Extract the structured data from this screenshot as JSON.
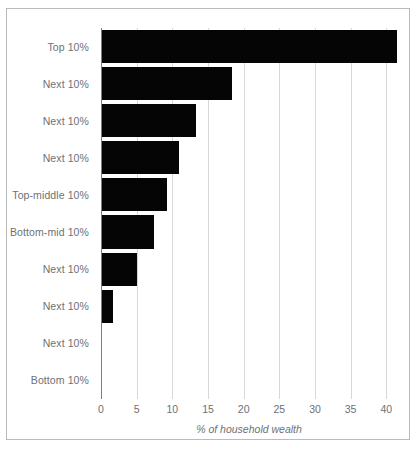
{
  "chart_data": {
    "type": "bar",
    "orientation": "horizontal",
    "title": "",
    "xlabel": "% of household wealth",
    "ylabel": "",
    "xlim": [
      0,
      41.5
    ],
    "xticks": [
      0,
      5,
      10,
      15,
      20,
      25,
      30,
      35,
      40
    ],
    "xtick_labels": [
      "0",
      "5",
      "10",
      "15",
      "20",
      "25",
      "30",
      "35",
      "40"
    ],
    "grid": "vertical",
    "legend": "none",
    "bar_color": "#050505",
    "grid_color": "#d5d7d9",
    "axis_color": "#7b7f82",
    "text_color": "#6d7174",
    "frame_color": "#b9bcbe",
    "categories": [
      "Top 10%",
      "Next 10%",
      "Next 10%",
      "Next 10%",
      "Top-middle 10%",
      "Bottom-mid 10%",
      "Next 10%",
      "Next 10%",
      "Next 10%",
      "Bottom 10%"
    ],
    "values": [
      41.5,
      18.3,
      13.3,
      11.0,
      9.3,
      7.5,
      5.0,
      1.7,
      0.2,
      0.0
    ]
  }
}
